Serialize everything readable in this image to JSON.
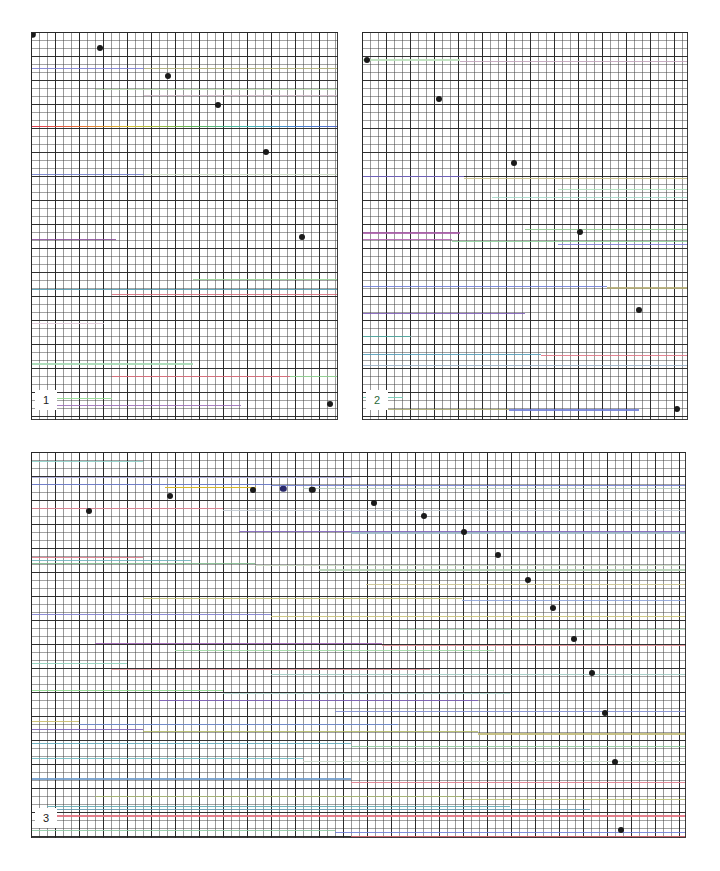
{
  "figure": {
    "width": 720,
    "height": 871,
    "background": "#ffffff",
    "grid": {
      "fine_spacing_px": 8,
      "coarse_spacing_px": 24,
      "fine_color": "#464646",
      "coarse_color": "#232323",
      "border_color": "#282828"
    },
    "point_color": "#1a1a1a",
    "point_radius_px": 3
  },
  "chart_data": {
    "type": "scatter",
    "title": "",
    "xlabel": "",
    "ylabel": "",
    "grid": true,
    "legend": "none",
    "panels": [
      {
        "label": "1",
        "label_color": "#222222",
        "rect": {
          "x": 31,
          "y": 32,
          "w": 307,
          "h": 388
        },
        "xlim": [
          0,
          38
        ],
        "ylim": [
          0,
          48
        ],
        "points": [
          {
            "x": 0.2,
            "y": 47.7,
            "color": "#1a1a1a",
            "r": 3.2
          },
          {
            "x": 8.6,
            "y": 46.0,
            "color": "#1a1a1a",
            "r": 3.0
          },
          {
            "x": 16.9,
            "y": 42.6,
            "color": "#1a1a1a",
            "r": 3.0
          },
          {
            "x": 23.2,
            "y": 39.0,
            "color": "#1a1a1a",
            "r": 3.0
          },
          {
            "x": 29.1,
            "y": 33.2,
            "color": "#1a1a1a",
            "r": 3.0
          },
          {
            "x": 33.6,
            "y": 22.6,
            "color": "#1a1a1a",
            "r": 3.0
          },
          {
            "x": 37.0,
            "y": 2.0,
            "color": "#1a1a1a",
            "r": 3.0
          }
        ],
        "rainbow_lines": [
          {
            "y": 36.4,
            "x_start": 0.0,
            "x_end": 38.0
          }
        ],
        "color_lines": [
          {
            "y": 43.6,
            "x_start": 0.0,
            "x_end": 14.0,
            "color": "#7a7ad0"
          },
          {
            "y": 43.6,
            "x_start": 14.0,
            "x_end": 38.0,
            "color": "#a8a870"
          },
          {
            "y": 41.0,
            "x_start": 8.0,
            "x_end": 38.0,
            "color": "#b8e0b0"
          },
          {
            "y": 40.2,
            "x_start": 14.0,
            "x_end": 38.0,
            "color": "#d0b8c8"
          },
          {
            "y": 30.4,
            "x_start": 0.0,
            "x_end": 14.0,
            "color": "#6a78c8"
          },
          {
            "y": 30.4,
            "x_start": 14.0,
            "x_end": 38.0,
            "color": "#c8d8c0"
          },
          {
            "y": 22.4,
            "x_start": 0.0,
            "x_end": 10.5,
            "color": "#8a4a9a"
          },
          {
            "y": 17.4,
            "x_start": 20.0,
            "x_end": 38.0,
            "color": "#90d090"
          },
          {
            "y": 16.2,
            "x_start": 0.0,
            "x_end": 38.0,
            "color": "#4a9ab0"
          },
          {
            "y": 15.6,
            "x_start": 10.0,
            "x_end": 38.0,
            "color": "#d86878"
          },
          {
            "y": 12.0,
            "x_start": 0.0,
            "x_end": 9.0,
            "color": "#e0c8d8"
          },
          {
            "y": 7.0,
            "x_start": 0.0,
            "x_end": 20.0,
            "color": "#a0d8b0"
          },
          {
            "y": 5.4,
            "x_start": 10.0,
            "x_end": 32.0,
            "color": "#e06878"
          },
          {
            "y": 5.4,
            "x_start": 32.0,
            "x_end": 38.0,
            "color": "#90d890"
          },
          {
            "y": 2.7,
            "x_start": 1.5,
            "x_end": 10.0,
            "color": "#88d888"
          },
          {
            "y": 1.9,
            "x_start": 1.5,
            "x_end": 26.0,
            "color": "#9a6ab8"
          }
        ]
      },
      {
        "label": "2",
        "label_color": "#2a6a3a",
        "rect": {
          "x": 362,
          "y": 32,
          "w": 326,
          "h": 388
        },
        "xlim": [
          0,
          40
        ],
        "ylim": [
          0,
          48
        ],
        "points": [
          {
            "x": 0.6,
            "y": 44.5,
            "color": "#1a1a1a",
            "r": 3.0
          },
          {
            "x": 9.5,
            "y": 39.7,
            "color": "#1a1a1a",
            "r": 3.0
          },
          {
            "x": 18.6,
            "y": 31.8,
            "color": "#1a1a1a",
            "r": 3.0
          },
          {
            "x": 26.8,
            "y": 23.3,
            "color": "#1a1a1a",
            "r": 3.0
          },
          {
            "x": 34.0,
            "y": 13.6,
            "color": "#1a1a1a",
            "r": 3.0
          },
          {
            "x": 38.6,
            "y": 1.4,
            "color": "#1a1a1a",
            "r": 3.0
          }
        ],
        "rainbow_lines": [],
        "color_lines": [
          {
            "y": 44.6,
            "x_start": 0.0,
            "x_end": 12.0,
            "color": "#b8e0b8"
          },
          {
            "y": 44.4,
            "x_start": 12.0,
            "x_end": 40.0,
            "color": "#c0a0b8"
          },
          {
            "y": 30.2,
            "x_start": 0.0,
            "x_end": 12.5,
            "color": "#7a6ad0"
          },
          {
            "y": 30.0,
            "x_start": 12.5,
            "x_end": 40.0,
            "color": "#c8c080"
          },
          {
            "y": 28.6,
            "x_start": 24.0,
            "x_end": 40.0,
            "color": "#a8e0b8"
          },
          {
            "y": 27.6,
            "x_start": 16.0,
            "x_end": 40.0,
            "color": "#a0d8c8"
          },
          {
            "y": 23.6,
            "x_start": 20.0,
            "x_end": 40.0,
            "color": "#88c888"
          },
          {
            "y": 23.2,
            "x_start": 0.0,
            "x_end": 12.0,
            "color": "#a85aa8"
          },
          {
            "y": 22.4,
            "x_start": 0.0,
            "x_end": 11.0,
            "color": "#b060b0"
          },
          {
            "y": 22.2,
            "x_start": 11.0,
            "x_end": 40.0,
            "color": "#8ad098"
          },
          {
            "y": 21.8,
            "x_start": 24.0,
            "x_end": 40.0,
            "color": "#7a7ad8"
          },
          {
            "y": 16.6,
            "x_start": 0.0,
            "x_end": 30.0,
            "color": "#6a7ad8"
          },
          {
            "y": 16.4,
            "x_start": 30.0,
            "x_end": 40.0,
            "color": "#b0a870"
          },
          {
            "y": 13.2,
            "x_start": 0.0,
            "x_end": 20.0,
            "color": "#7a58b8"
          },
          {
            "y": 10.4,
            "x_start": 0.0,
            "x_end": 6.0,
            "color": "#4aa8a0"
          },
          {
            "y": 8.2,
            "x_start": 0.0,
            "x_end": 22.0,
            "color": "#4a9ab8"
          },
          {
            "y": 8.0,
            "x_start": 22.0,
            "x_end": 40.0,
            "color": "#e07080"
          },
          {
            "y": 6.8,
            "x_start": 0.0,
            "x_end": 40.0,
            "color": "#98b0c8"
          },
          {
            "y": 2.8,
            "x_start": 0.0,
            "x_end": 5.0,
            "color": "#68c8b0"
          },
          {
            "y": 1.4,
            "x_start": 3.0,
            "x_end": 18.0,
            "color": "#a8a868"
          },
          {
            "y": 1.3,
            "x_start": 18.0,
            "x_end": 34.0,
            "color": "#6a7ad8"
          }
        ]
      },
      {
        "label": "3",
        "label_color": "#222222",
        "rect": {
          "x": 31,
          "y": 452,
          "w": 655,
          "h": 386
        },
        "xlim": [
          0,
          82
        ],
        "ylim": [
          0,
          48
        ],
        "points": [
          {
            "x": 17.4,
            "y": 42.5,
            "color": "#1a1a1a",
            "r": 3.0
          },
          {
            "x": 27.8,
            "y": 43.3,
            "color": "#1a1a1a",
            "r": 3.0
          },
          {
            "x": 35.2,
            "y": 43.3,
            "color": "#1a1a1a",
            "r": 3.2
          },
          {
            "x": 7.2,
            "y": 40.7,
            "color": "#1a1a1a",
            "r": 3.0
          },
          {
            "x": 43.0,
            "y": 41.6,
            "color": "#1a1a1a",
            "r": 3.0
          },
          {
            "x": 49.2,
            "y": 40.0,
            "color": "#1a1a1a",
            "r": 3.0
          },
          {
            "x": 54.2,
            "y": 38.0,
            "color": "#1a1a1a",
            "r": 3.0
          },
          {
            "x": 58.5,
            "y": 35.2,
            "color": "#1a1a1a",
            "r": 3.0
          },
          {
            "x": 62.2,
            "y": 32.1,
            "color": "#1a1a1a",
            "r": 3.0
          },
          {
            "x": 65.4,
            "y": 28.6,
            "color": "#1a1a1a",
            "r": 3.0
          },
          {
            "x": 68.0,
            "y": 24.7,
            "color": "#1a1a1a",
            "r": 3.0
          },
          {
            "x": 70.2,
            "y": 20.5,
            "color": "#1a1a1a",
            "r": 3.0
          },
          {
            "x": 71.9,
            "y": 15.6,
            "color": "#1a1a1a",
            "r": 3.0
          },
          {
            "x": 73.1,
            "y": 9.5,
            "color": "#1a1a1a",
            "r": 3.0
          },
          {
            "x": 73.8,
            "y": 1.0,
            "color": "#1a1a1a",
            "r": 3.0
          }
        ],
        "blue_points": [
          {
            "x": 31.6,
            "y": 43.4,
            "color": "#2a2a6a",
            "r": 3.2
          }
        ],
        "rainbow_lines": [],
        "orange_lines": [
          {
            "y": 43.7,
            "x_start": 16.8,
            "x_end": 28.2,
            "color": "#d8b82a"
          }
        ],
        "color_lines": [
          {
            "y": 46.9,
            "x_start": 0.0,
            "x_end": 14.0,
            "color": "#88d0c8"
          },
          {
            "y": 44.9,
            "x_start": 0.0,
            "x_end": 40.0,
            "color": "#a8a8d8"
          },
          {
            "y": 44.0,
            "x_start": 0.0,
            "x_end": 30.0,
            "color": "#6a7ad0"
          },
          {
            "y": 43.9,
            "x_start": 30.0,
            "x_end": 82.0,
            "color": "#6a7ad0"
          },
          {
            "y": 43.5,
            "x_start": 34.0,
            "x_end": 82.0,
            "color": "#b0c8b8"
          },
          {
            "y": 41.0,
            "x_start": 0.0,
            "x_end": 24.0,
            "color": "#e08090"
          },
          {
            "y": 40.8,
            "x_start": 24.0,
            "x_end": 82.0,
            "color": "#c0c8d0"
          },
          {
            "y": 38.2,
            "x_start": 26.0,
            "x_end": 82.0,
            "color": "#7a5ab8"
          },
          {
            "y": 38.0,
            "x_start": 40.0,
            "x_end": 82.0,
            "color": "#9ab8c8"
          },
          {
            "y": 35.0,
            "x_start": 0.0,
            "x_end": 14.0,
            "color": "#e07888"
          },
          {
            "y": 34.6,
            "x_start": 0.0,
            "x_end": 20.0,
            "color": "#68b0b8"
          },
          {
            "y": 34.2,
            "x_start": 0.0,
            "x_end": 28.0,
            "color": "#7ab888"
          },
          {
            "y": 34.0,
            "x_start": 28.0,
            "x_end": 82.0,
            "color": "#c8d8c0"
          },
          {
            "y": 33.4,
            "x_start": 36.0,
            "x_end": 82.0,
            "color": "#b0d0b0"
          },
          {
            "y": 31.6,
            "x_start": 42.0,
            "x_end": 82.0,
            "color": "#c8c088"
          },
          {
            "y": 29.8,
            "x_start": 14.0,
            "x_end": 54.0,
            "color": "#c0c070"
          },
          {
            "y": 29.6,
            "x_start": 54.0,
            "x_end": 82.0,
            "color": "#8aa0d8"
          },
          {
            "y": 27.9,
            "x_start": 0.0,
            "x_end": 30.0,
            "color": "#7a7ad0"
          },
          {
            "y": 27.6,
            "x_start": 30.0,
            "x_end": 82.0,
            "color": "#c8c070"
          },
          {
            "y": 26.0,
            "x_start": 46.0,
            "x_end": 82.0,
            "color": "#a8d8b8"
          },
          {
            "y": 24.2,
            "x_start": 8.0,
            "x_end": 44.0,
            "color": "#9a5ab0"
          },
          {
            "y": 24.0,
            "x_start": 44.0,
            "x_end": 82.0,
            "color": "#e08890"
          },
          {
            "y": 23.4,
            "x_start": 18.0,
            "x_end": 58.0,
            "color": "#9ad8a0"
          },
          {
            "y": 21.8,
            "x_start": 0.0,
            "x_end": 12.0,
            "color": "#88d0b8"
          },
          {
            "y": 21.0,
            "x_start": 10.0,
            "x_end": 50.0,
            "color": "#e09098"
          },
          {
            "y": 20.4,
            "x_start": 30.0,
            "x_end": 82.0,
            "color": "#9ac8c0"
          },
          {
            "y": 18.4,
            "x_start": 0.0,
            "x_end": 24.0,
            "color": "#88d888"
          },
          {
            "y": 18.0,
            "x_start": 24.0,
            "x_end": 60.0,
            "color": "#b0d8d0"
          },
          {
            "y": 17.2,
            "x_start": 16.0,
            "x_end": 56.0,
            "color": "#7a5ab8"
          },
          {
            "y": 15.8,
            "x_start": 38.0,
            "x_end": 82.0,
            "color": "#7a88d0"
          },
          {
            "y": 14.6,
            "x_start": 0.0,
            "x_end": 6.0,
            "color": "#c8b860"
          },
          {
            "y": 14.2,
            "x_start": 6.0,
            "x_end": 46.0,
            "color": "#6a88d0"
          },
          {
            "y": 13.6,
            "x_start": 0.0,
            "x_end": 14.0,
            "color": "#7a5ab8"
          },
          {
            "y": 13.3,
            "x_start": 14.0,
            "x_end": 56.0,
            "color": "#b0b860"
          },
          {
            "y": 13.0,
            "x_start": 56.0,
            "x_end": 82.0,
            "color": "#c0b870"
          },
          {
            "y": 11.8,
            "x_start": 0.0,
            "x_end": 40.0,
            "color": "#5aa8b8"
          },
          {
            "y": 11.4,
            "x_start": 40.0,
            "x_end": 82.0,
            "color": "#88c898"
          },
          {
            "y": 10.0,
            "x_start": 0.0,
            "x_end": 34.0,
            "color": "#6ab8c0"
          },
          {
            "y": 9.6,
            "x_start": 34.0,
            "x_end": 82.0,
            "color": "#c8d8c8"
          },
          {
            "y": 7.4,
            "x_start": 0.0,
            "x_end": 40.0,
            "color": "#6a98c8"
          },
          {
            "y": 7.0,
            "x_start": 40.0,
            "x_end": 82.0,
            "color": "#e07888"
          },
          {
            "y": 5.2,
            "x_start": 8.0,
            "x_end": 54.0,
            "color": "#a8b870"
          },
          {
            "y": 4.8,
            "x_start": 54.0,
            "x_end": 82.0,
            "color": "#b8c070"
          },
          {
            "y": 4.0,
            "x_start": 2.0,
            "x_end": 60.0,
            "color": "#5aa8b0"
          },
          {
            "y": 3.6,
            "x_start": 2.0,
            "x_end": 70.0,
            "color": "#5a98b0"
          },
          {
            "y": 2.8,
            "x_start": 2.0,
            "x_end": 82.0,
            "color": "#e06878"
          },
          {
            "y": 1.0,
            "x_start": 0.0,
            "x_end": 38.0,
            "color": "#88c8a0"
          },
          {
            "y": 0.8,
            "x_start": 38.0,
            "x_end": 82.0,
            "color": "#6a7ad8"
          },
          {
            "y": 0.3,
            "x_start": 40.0,
            "x_end": 82.0,
            "color": "#e06878"
          }
        ]
      }
    ]
  }
}
